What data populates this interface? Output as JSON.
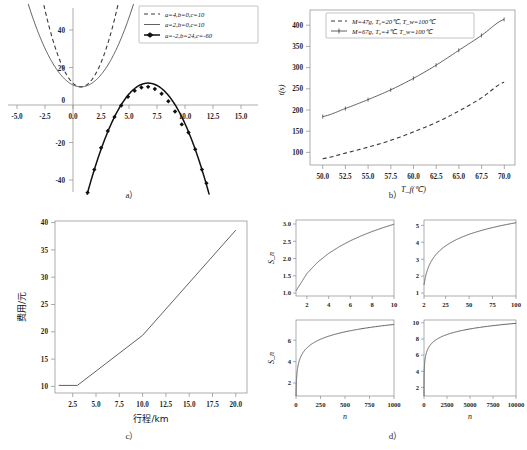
{
  "figure": {
    "panels": [
      {
        "id": "a",
        "label": "a）"
      },
      {
        "id": "b",
        "label": "b）"
      },
      {
        "id": "c",
        "label": "c）"
      },
      {
        "id": "d",
        "label": "d）"
      }
    ]
  },
  "chart_data": [
    {
      "id": "a",
      "type": "line",
      "title": "",
      "xlabel": "",
      "ylabel": "",
      "xlim": [
        -6.5,
        15.8
      ],
      "ylim": [
        -46,
        52
      ],
      "xticks": [
        "-5.0",
        "-2.5",
        "0.0",
        "2.5",
        "5.0",
        "7.5",
        "10.0",
        "12.5",
        "15.0"
      ],
      "xtickvals": [
        -5.0,
        -2.5,
        0.0,
        2.5,
        5.0,
        7.5,
        10.0,
        12.5,
        15.0
      ],
      "yticks": [
        "40",
        "20",
        "0",
        "-20",
        "-40"
      ],
      "ytickvals": [
        40,
        20,
        0,
        -20,
        -40
      ],
      "grid": false,
      "legend_position": "upper right",
      "series": [
        {
          "name": "a=4,b=0,c=10",
          "style": "dashed",
          "equation": "y = 4x^2 + 0x + 10",
          "a": 4,
          "b": 0,
          "c": 10,
          "x": [
            -3.2,
            -2.8,
            -2.4,
            -2.0,
            -1.6,
            -1.2,
            -0.8,
            -0.4,
            0,
            0.4,
            0.8,
            1.2,
            1.6,
            2.0,
            2.4,
            2.8,
            3.2
          ],
          "y": [
            50.96,
            41.36,
            33.04,
            26,
            20.24,
            15.76,
            12.56,
            10.64,
            10,
            10.64,
            12.56,
            15.76,
            20.24,
            26,
            33.04,
            41.36,
            50.96
          ]
        },
        {
          "name": "a=2,b=0,c=10",
          "style": "solid",
          "equation": "y = 2x^2 + 0x + 10",
          "a": 2,
          "b": 0,
          "c": 10,
          "x": [
            -4.6,
            -4.0,
            -3.4,
            -2.8,
            -2.2,
            -1.6,
            -1.0,
            -0.4,
            0,
            0.4,
            1.0,
            1.6,
            2.2,
            2.8,
            3.4,
            4.0,
            4.6
          ],
          "y": [
            52.32,
            42,
            33.12,
            25.68,
            19.68,
            15.12,
            12,
            10.32,
            10,
            10.32,
            12,
            15.12,
            19.68,
            25.68,
            33.12,
            42,
            52.32
          ]
        },
        {
          "name": "a=-2,b=24,c=-60",
          "style": "solid-markers",
          "equation": "y = -2x^2 + 24x - 60",
          "a": -2,
          "b": 24,
          "c": -60,
          "x": [
            0.6,
            1.2,
            1.8,
            2.4,
            3.0,
            3.6,
            4.2,
            4.8,
            5.4,
            6.0,
            6.6,
            7.2,
            7.8,
            8.4,
            9.0,
            9.6,
            10.2,
            10.8,
            11.2
          ],
          "y": [
            -46.32,
            -34.08,
            -22.48,
            -13.52,
            -6.0,
            0.08,
            4.72,
            7.92,
            9.68,
            10.0,
            8.88,
            6.32,
            2.32,
            -3.12,
            -10.0,
            -14.32,
            -23.28,
            -34.08,
            -41.28
          ]
        }
      ]
    },
    {
      "id": "b",
      "type": "line",
      "title": "",
      "xlabel": "T_f(℃)",
      "ylabel": "t(s)",
      "xlim": [
        48.6,
        71.2
      ],
      "ylim": [
        55,
        420
      ],
      "xticks": [
        "50.0",
        "52.5",
        "55.0",
        "57.5",
        "60.0",
        "62.5",
        "65.0",
        "67.5",
        "70.0"
      ],
      "xtickvals": [
        50.0,
        52.5,
        55.0,
        57.5,
        60.0,
        62.5,
        65.0,
        67.5,
        70.0
      ],
      "yticks": [
        "100",
        "150",
        "200",
        "250",
        "300",
        "350",
        "400"
      ],
      "ytickvals": [
        100,
        150,
        200,
        250,
        300,
        350,
        400
      ],
      "grid": false,
      "legend_position": "upper left",
      "series": [
        {
          "name": "M=47g, T₀=20℃, T_w=100℃",
          "style": "dashed",
          "x": [
            50,
            52.5,
            55,
            57.5,
            60,
            62.5,
            65,
            67.5,
            70
          ],
          "y": [
            70,
            83,
            97,
            113,
            133,
            155,
            182,
            213,
            250
          ]
        },
        {
          "name": "M=67g, T₀=4℃, T_w=100℃",
          "style": "solid-markers",
          "x": [
            50,
            52.5,
            55,
            57.5,
            60,
            62.5,
            65,
            67.5,
            70
          ],
          "y": [
            169,
            188,
            209,
            232,
            259,
            290,
            325,
            360,
            398
          ]
        }
      ]
    },
    {
      "id": "c",
      "type": "line",
      "title": "",
      "xlabel": "行程/km",
      "ylabel": "费用/元",
      "xlim": [
        0.6,
        21.2
      ],
      "ylim": [
        8.5,
        42.5
      ],
      "xticks": [
        "2.5",
        "5.0",
        "7.5",
        "10.0",
        "12.5",
        "15.0",
        "17.5",
        "20.0"
      ],
      "xtickvals": [
        2.5,
        5.0,
        7.5,
        10.0,
        12.5,
        15.0,
        17.5,
        20.0
      ],
      "yticks": [
        "10",
        "15",
        "20",
        "25",
        "30",
        "35",
        "40"
      ],
      "ytickvals": [
        10,
        15,
        20,
        25,
        30,
        35,
        40
      ],
      "grid": false,
      "legend_position": "none",
      "series": [
        {
          "name": "出租车费用",
          "style": "solid",
          "x": [
            1.0,
            3.0,
            10.0,
            20.0
          ],
          "y": [
            10.0,
            10.0,
            19.9,
            40.7
          ]
        }
      ]
    },
    {
      "id": "d",
      "type": "line",
      "title": "",
      "xlabel": "n",
      "ylabel": "S_n",
      "grid": false,
      "legend_position": "none",
      "subplots": [
        {
          "id": "d1",
          "position": "top-left",
          "xlabel": "",
          "ylabel": "S_n",
          "xlim": [
            1,
            10
          ],
          "ylim": [
            0.85,
            3.05
          ],
          "xticks": [
            "2",
            "4",
            "6",
            "8",
            "10"
          ],
          "xtickvals": [
            2,
            4,
            6,
            8,
            10
          ],
          "yticks": [
            "1.0",
            "1.5",
            "2.0",
            "2.5",
            "3.0"
          ],
          "ytickvals": [
            1.0,
            1.5,
            2.0,
            2.5,
            3.0
          ],
          "x": [
            1,
            2,
            3,
            4,
            5,
            6,
            7,
            8,
            9,
            10
          ],
          "y": [
            1.0,
            1.5,
            1.833,
            2.083,
            2.283,
            2.45,
            2.593,
            2.718,
            2.829,
            2.929
          ]
        },
        {
          "id": "d2",
          "position": "top-right",
          "xlabel": "",
          "ylabel": "",
          "xlim": [
            2,
            100
          ],
          "ylim": [
            0.85,
            5.35
          ],
          "xticks": [
            "2",
            "25",
            "50",
            "75",
            "100"
          ],
          "xtickvals": [
            2,
            25,
            50,
            75,
            100
          ],
          "yticks": [
            "1",
            "2",
            "3",
            "4",
            "5"
          ],
          "ytickvals": [
            1,
            2,
            3,
            4,
            5
          ],
          "x": [
            1,
            2,
            3,
            5,
            10,
            20,
            30,
            40,
            50,
            60,
            70,
            80,
            90,
            100
          ],
          "y": [
            1.0,
            1.5,
            1.833,
            2.283,
            2.929,
            3.598,
            3.995,
            4.279,
            4.499,
            4.679,
            4.832,
            4.965,
            5.083,
            5.187
          ]
        },
        {
          "id": "d3",
          "position": "bottom-left",
          "xlabel": "n",
          "ylabel": "S_n",
          "xlim": [
            0,
            1000
          ],
          "ylim": [
            0.8,
            7.9
          ],
          "xticks": [
            "0",
            "250",
            "500",
            "750",
            "1000"
          ],
          "xtickvals": [
            0,
            250,
            500,
            750,
            1000
          ],
          "yticks": [
            "2",
            "4",
            "6"
          ],
          "ytickvals": [
            2,
            4,
            6
          ],
          "x": [
            1,
            2,
            5,
            10,
            25,
            50,
            100,
            200,
            300,
            400,
            500,
            600,
            700,
            800,
            900,
            1000
          ],
          "y": [
            1.0,
            1.5,
            2.283,
            2.929,
            3.816,
            4.499,
            5.187,
            5.878,
            6.283,
            6.57,
            6.793,
            6.975,
            7.129,
            7.262,
            7.38,
            7.486
          ]
        },
        {
          "id": "d4",
          "position": "bottom-right",
          "xlabel": "n",
          "ylabel": "",
          "xlim": [
            0,
            10000
          ],
          "ylim": [
            0.8,
            10.2
          ],
          "xticks": [
            "0",
            "2500",
            "5000",
            "7500",
            "10000"
          ],
          "xtickvals": [
            0,
            2500,
            5000,
            7500,
            10000
          ],
          "yticks": [
            "2",
            "4",
            "6",
            "8",
            "10"
          ],
          "ytickvals": [
            2,
            4,
            6,
            8,
            10
          ],
          "x": [
            1,
            2,
            5,
            10,
            50,
            100,
            250,
            500,
            1000,
            2000,
            2500,
            4000,
            5000,
            6000,
            7500,
            8500,
            10000
          ],
          "y": [
            1.0,
            1.5,
            2.283,
            2.929,
            4.499,
            5.187,
            6.103,
            6.793,
            7.486,
            8.178,
            8.402,
            8.872,
            9.095,
            9.277,
            9.5,
            9.625,
            9.788
          ]
        }
      ]
    }
  ]
}
